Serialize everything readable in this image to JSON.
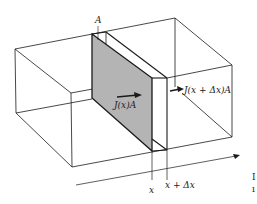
{
  "figure": {
    "type": "flux-through-slab-diagram",
    "labels": {
      "area": "A",
      "flux_in": "J(x)A",
      "flux_out": "J(x + Δx)A",
      "x": "x",
      "x_plus_dx": "x + Δx"
    },
    "margin_glyphs": [
      "I",
      "ı"
    ],
    "colors": {
      "line": "#1a1a1a",
      "slab_fill": "#b4b4b4",
      "background": "#ffffff"
    }
  }
}
